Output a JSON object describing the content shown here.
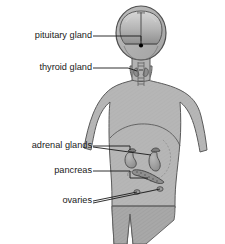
{
  "figure": {
    "background_color": "#ffffff",
    "body_fill": "#b6b6b6",
    "body_stroke": "#5a5a5a",
    "organ_fill": "#9e9e9e",
    "organ_stroke": "#4a4a4a",
    "leader_color": "#1a1a1a",
    "label_color": "#1a1a1a",
    "pituitary_dot_color": "#000000"
  },
  "labels": [
    {
      "id": "pituitary",
      "text": "pituitary gland",
      "x": 92,
      "y": 38
    },
    {
      "id": "thyroid",
      "text": "thyroid gland",
      "x": 92,
      "y": 70
    },
    {
      "id": "adrenal_glands",
      "text": "adrenal glands",
      "x": 92,
      "y": 148
    },
    {
      "id": "pancreas",
      "text": "pancreas",
      "x": 92,
      "y": 173
    },
    {
      "id": "ovaries",
      "text": "ovaries",
      "x": 92,
      "y": 203
    }
  ],
  "structures": [
    {
      "id": "brain",
      "name": "brain-cross-section"
    },
    {
      "id": "pituitary_gland",
      "name": "pituitary-gland-dot"
    },
    {
      "id": "thyroid_gland",
      "name": "thyroid-gland"
    },
    {
      "id": "trachea",
      "name": "trachea"
    },
    {
      "id": "left_kidney",
      "name": "left-kidney"
    },
    {
      "id": "right_kidney",
      "name": "right-kidney"
    },
    {
      "id": "left_adrenal",
      "name": "left-adrenal-gland"
    },
    {
      "id": "right_adrenal",
      "name": "right-adrenal-gland"
    },
    {
      "id": "pancreas_organ",
      "name": "pancreas"
    },
    {
      "id": "left_ovary",
      "name": "left-ovary"
    },
    {
      "id": "right_ovary",
      "name": "right-ovary"
    },
    {
      "id": "uterus",
      "name": "uterus-outline"
    },
    {
      "id": "diaphragm",
      "name": "diaphragm-line"
    }
  ]
}
